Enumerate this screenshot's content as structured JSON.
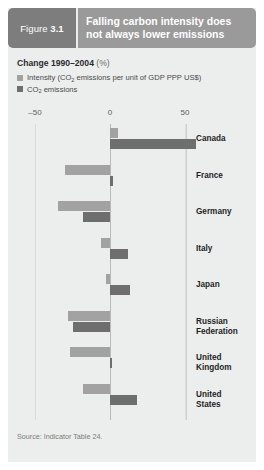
{
  "figure": {
    "tag_prefix": "Figure",
    "tag_number": "3.1",
    "title": "Falling carbon intensity does not always lower emissions"
  },
  "legend": {
    "title_main": "Change 1990–2004",
    "title_unit": "(%)",
    "items": [
      {
        "label_pre": "Intensity (CO",
        "label_sub": "2",
        "label_post": " emissions per unit of GDP PPP US$)",
        "color": "#a2a2a2",
        "key": "intensity"
      },
      {
        "label_pre": "CO",
        "label_sub": "2",
        "label_post": " emissions",
        "color": "#6e6e6e",
        "key": "co2"
      }
    ]
  },
  "source": "Source: Indicator Table 24.",
  "colors": {
    "panel_bg": "#eceded",
    "header_tag_bg": "#7d7d7d",
    "header_title_bg": "#9a9a9a",
    "intensity": "#a2a2a2",
    "co2": "#6e6e6e",
    "gridline": "#dcdcdc",
    "zeroline": "#b9b9b9"
  },
  "chart_data": {
    "type": "bar",
    "orientation": "horizontal",
    "title": "Falling carbon intensity does not always lower emissions",
    "subtitle": "Change 1990–2004 (%)",
    "xlabel": "",
    "ylabel": "",
    "xlim": [
      -50,
      50
    ],
    "xticks": [
      -50,
      0,
      50
    ],
    "xtick_labels": [
      "–50",
      "0",
      "50"
    ],
    "grid": true,
    "legend_position": "top-left",
    "categories": [
      "Canada",
      "France",
      "Germany",
      "Italy",
      "Japan",
      "Russian Federation",
      "United Kingdom",
      "United States"
    ],
    "series": [
      {
        "name": "Intensity (CO2 emissions per unit of GDP PPP US$)",
        "color": "#a2a2a2",
        "values": [
          5,
          -30,
          -35,
          -6,
          -3,
          -28,
          -27,
          -18
        ]
      },
      {
        "name": "CO2 emissions",
        "color": "#6e6e6e",
        "values": [
          57,
          2,
          -18,
          12,
          13,
          -25,
          1,
          18
        ]
      }
    ]
  }
}
